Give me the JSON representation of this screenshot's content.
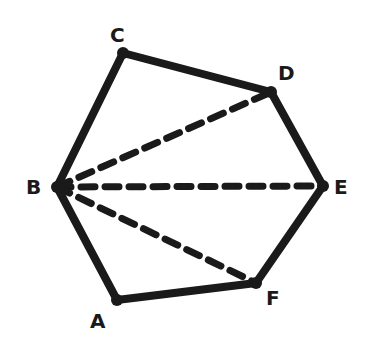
{
  "diagram": {
    "type": "hexagon-triangulation",
    "vertices": [
      {
        "id": "A",
        "x": 117,
        "y": 300,
        "label": "A",
        "lx": 90,
        "ly": 328
      },
      {
        "id": "B",
        "x": 57,
        "y": 187,
        "label": "B",
        "lx": 26,
        "ly": 194
      },
      {
        "id": "C",
        "x": 123,
        "y": 53,
        "label": "C",
        "lx": 110,
        "ly": 42
      },
      {
        "id": "D",
        "x": 271,
        "y": 92,
        "label": "D",
        "lx": 278,
        "ly": 80
      },
      {
        "id": "E",
        "x": 323,
        "y": 186,
        "label": "E",
        "lx": 334,
        "ly": 194
      },
      {
        "id": "F",
        "x": 256,
        "y": 283,
        "label": "F",
        "lx": 266,
        "ly": 305
      }
    ],
    "edges": [
      [
        "A",
        "B"
      ],
      [
        "B",
        "C"
      ],
      [
        "C",
        "D"
      ],
      [
        "D",
        "E"
      ],
      [
        "E",
        "F"
      ],
      [
        "F",
        "A"
      ]
    ],
    "diagonals": [
      [
        "B",
        "D"
      ],
      [
        "B",
        "E"
      ],
      [
        "B",
        "F"
      ]
    ],
    "colors": {
      "stroke": "#1a1a1a",
      "background": "#ffffff"
    }
  }
}
